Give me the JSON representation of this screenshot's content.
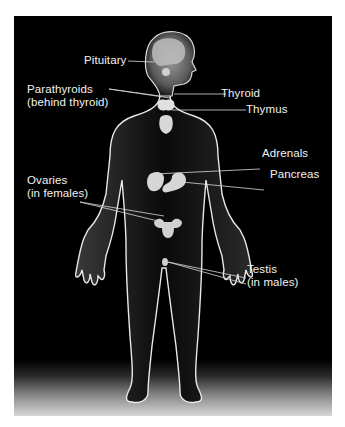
{
  "diagram": {
    "background_color": "#000000",
    "label_color": "#f2f2f2",
    "labels": {
      "pituitary": {
        "line1": "Pituitary"
      },
      "parathyroids": {
        "line1": "Parathyroids",
        "line2": "(behind thyroid)"
      },
      "thyroid": {
        "line1": "Thyroid"
      },
      "thymus": {
        "line1": "Thymus"
      },
      "adrenals": {
        "line1": "Adrenals"
      },
      "pancreas": {
        "line1": "Pancreas"
      },
      "ovaries": {
        "line1": "Ovaries",
        "line2": "(in females)"
      },
      "testis": {
        "line1": "Testis",
        "line2": "(in males)"
      }
    }
  }
}
